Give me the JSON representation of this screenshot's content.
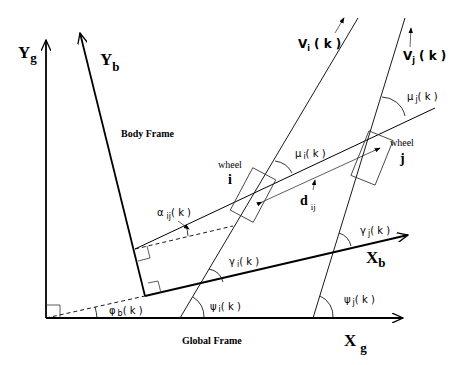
{
  "diagram": {
    "frames": {
      "global_label": "Global Frame",
      "body_label": "Body Frame"
    },
    "axes": {
      "xg": {
        "main": "X",
        "sub": "g"
      },
      "yg": {
        "main": "Y",
        "sub": "g"
      },
      "xb": {
        "main": "X",
        "sub": "b"
      },
      "yb": {
        "main": "Y",
        "sub": "b"
      }
    },
    "wheels": {
      "i": {
        "caption": "wheel",
        "letter": "i"
      },
      "j": {
        "caption": "wheel",
        "letter": "j"
      }
    },
    "velocities": {
      "vi": {
        "main": "V",
        "sub": "i",
        "arg": "( k )"
      },
      "vj": {
        "main": "V",
        "sub": "j",
        "arg": "( k )"
      }
    },
    "distance": {
      "main": "d",
      "sub": "ij"
    },
    "angles": {
      "alpha_ij": {
        "main": "α",
        "sub": "ij",
        "arg": "( k )"
      },
      "mu_i": {
        "main": "μ",
        "sub": "i",
        "arg": "( k )"
      },
      "mu_j": {
        "main": "μ",
        "sub": "j",
        "arg": "( k )"
      },
      "gamma_i": {
        "main": "γ",
        "sub": "i",
        "arg": "( k )"
      },
      "gamma_j": {
        "main": "γ",
        "sub": "j",
        "arg": "( k )"
      },
      "psi_i": {
        "main": "ψ",
        "sub": "i",
        "arg": "( k )"
      },
      "psi_j": {
        "main": "ψ",
        "sub": "j",
        "arg": "( k )"
      },
      "phi_b": {
        "main": "φ",
        "sub": "b",
        "arg": "( k )"
      }
    },
    "colors": {
      "line": "#000000",
      "thin": "#333333",
      "background": "#ffffff"
    }
  }
}
